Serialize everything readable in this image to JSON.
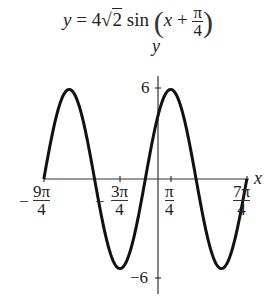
{
  "title": {
    "lhs": "y",
    "eq": "=",
    "coef": "4",
    "radical": "2",
    "func": "sin",
    "inner_var": "x",
    "plus": "+",
    "frac_num": "π",
    "frac_den": "4"
  },
  "axes": {
    "x_label": "x",
    "y_label": "y",
    "y_tick_top": "6",
    "y_tick_bottom": "−6"
  },
  "x_ticks": [
    {
      "sign": "−",
      "num": "9π",
      "den": "4"
    },
    {
      "sign": "−",
      "num": "3π",
      "den": "4"
    },
    {
      "sign": "",
      "num": "π",
      "den": "4"
    },
    {
      "sign": "",
      "num": "7π",
      "den": "4"
    }
  ],
  "chart_data": {
    "type": "line",
    "xlabel": "x",
    "ylabel": "y",
    "function": "4*sqrt(2)*sin(x + pi/4)",
    "amplitude": 5.657,
    "period": "2π",
    "phase_shift": "-π/4",
    "x_range": [
      "-9π/4",
      "7π/4"
    ],
    "x_range_numeric": [
      -7.0686,
      5.4978
    ],
    "ylim": [
      -6,
      6
    ],
    "x_ticks": [
      "-9π/4",
      "-3π/4",
      "π/4",
      "7π/4"
    ],
    "y_ticks": [
      -6,
      6
    ],
    "grid": false,
    "key_points": [
      {
        "x": "-9π/4",
        "y": 0
      },
      {
        "x": "-7π/4",
        "y": 5.657
      },
      {
        "x": "-5π/4",
        "y": 0
      },
      {
        "x": "-3π/4",
        "y": -5.657
      },
      {
        "x": "-π/4",
        "y": 0
      },
      {
        "x": "π/4",
        "y": 5.657
      },
      {
        "x": "3π/4",
        "y": 0
      },
      {
        "x": "5π/4",
        "y": -5.657
      },
      {
        "x": "7π/4",
        "y": 0
      }
    ],
    "stroke_color": "#111111"
  }
}
